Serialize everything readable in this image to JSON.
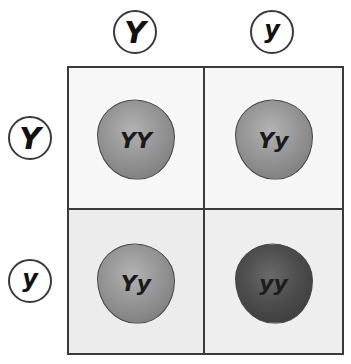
{
  "top_alleles": [
    {
      "label": "Y",
      "size": "big"
    },
    {
      "label": "y",
      "size": "small"
    }
  ],
  "left_alleles": [
    {
      "label": "Y",
      "size": "big"
    },
    {
      "label": "y",
      "size": "small"
    }
  ],
  "cells": [
    {
      "genotype": "YY",
      "shade": "light"
    },
    {
      "genotype": "Yy",
      "shade": "light"
    },
    {
      "genotype": "Yy",
      "shade": "light"
    },
    {
      "genotype": "yy",
      "shade": "dark"
    }
  ],
  "colors": {
    "border": "#3a3a3a",
    "pea_light": "#989898",
    "pea_dark": "#4d4d4d"
  }
}
